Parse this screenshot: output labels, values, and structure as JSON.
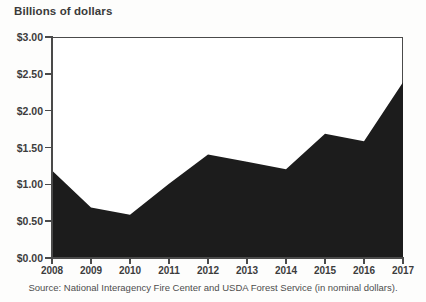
{
  "chart_data": {
    "type": "area",
    "title": "Billions of dollars",
    "xlabel": "",
    "ylabel": "Billions of dollars",
    "categories": [
      "2008",
      "2009",
      "2010",
      "2011",
      "2012",
      "2013",
      "2014",
      "2015",
      "2016",
      "2017"
    ],
    "values": [
      1.2,
      0.7,
      0.6,
      1.02,
      1.42,
      1.32,
      1.22,
      1.7,
      1.6,
      2.4
    ],
    "series": [
      {
        "name": "Federal wildfire suppression spending",
        "values": [
          1.2,
          0.7,
          0.6,
          1.02,
          1.42,
          1.32,
          1.22,
          1.7,
          1.6,
          2.4
        ]
      }
    ],
    "ylim": [
      0,
      3.0
    ],
    "ytick_values": [
      0.0,
      0.5,
      1.0,
      1.5,
      2.0,
      2.5,
      3.0
    ],
    "ytick_labels": [
      "$0.00",
      "$0.50",
      "$1.00",
      "$1.50",
      "$2.00",
      "$2.50",
      "$3.00"
    ],
    "xtick_labels": [
      "2008",
      "2009",
      "2010",
      "2011",
      "2012",
      "2013",
      "2014",
      "2015",
      "2016",
      "2017"
    ],
    "grid": false,
    "legend": "none",
    "area_color": "#1c1c1c",
    "axis_color": "#4a4a4a",
    "text_color": "#3c3c3c",
    "background_color": "#ffffff",
    "annotations": []
  },
  "figure": {
    "axis_title": "Billions of dollars",
    "source_note": "Source: National Interagency Fire Center and USDA Forest Service (in nominal dollars)."
  }
}
